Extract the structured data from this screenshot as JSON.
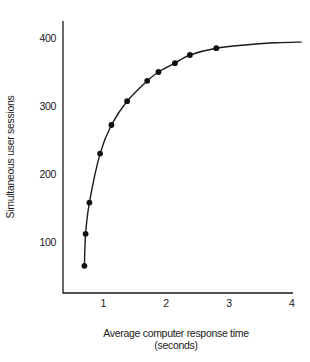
{
  "chart_data": {
    "type": "line",
    "markers": true,
    "title": "",
    "xlabel": "Average computer response time",
    "xlabel_unit": "(seconds)",
    "ylabel": "Simultaneous user sessions",
    "xticks": [
      1,
      2,
      3,
      4
    ],
    "yticks": [
      100,
      200,
      300,
      400
    ],
    "xlim": [
      0.36,
      4.02
    ],
    "ylim": [
      25,
      425
    ],
    "grid": false,
    "points": [
      {
        "x": 0.7,
        "y": 65
      },
      {
        "x": 0.72,
        "y": 112
      },
      {
        "x": 0.78,
        "y": 158
      },
      {
        "x": 0.95,
        "y": 230
      },
      {
        "x": 1.13,
        "y": 272
      },
      {
        "x": 1.38,
        "y": 307
      },
      {
        "x": 1.7,
        "y": 337
      },
      {
        "x": 1.88,
        "y": 350
      },
      {
        "x": 2.14,
        "y": 363
      },
      {
        "x": 2.38,
        "y": 375
      },
      {
        "x": 2.8,
        "y": 385
      }
    ],
    "curve_extension": [
      {
        "x": 3.3,
        "y": 390
      },
      {
        "x": 3.75,
        "y": 393
      },
      {
        "x": 4.15,
        "y": 394
      }
    ],
    "colors": {
      "line": "#1a1a1a",
      "marker": "#111111",
      "text": "#1a1a1a",
      "background": "#ffffff"
    }
  }
}
